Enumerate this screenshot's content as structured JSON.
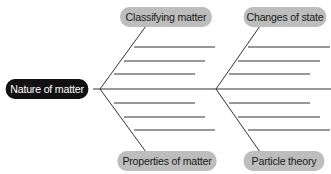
{
  "diagram": {
    "type": "fishbone",
    "head": {
      "label": "Nature of matter",
      "style": "dark"
    },
    "branches": [
      {
        "label": "Classifying matter",
        "position": "top-left",
        "lines": 3
      },
      {
        "label": "Changes of state",
        "position": "top-right",
        "lines": 3
      },
      {
        "label": "Properties of matter",
        "position": "bottom-left",
        "lines": 3
      },
      {
        "label": "Particle theory",
        "position": "bottom-right",
        "lines": 3
      }
    ],
    "colors": {
      "head_bg": "#111111",
      "head_text": "#ffffff",
      "branch_bg": "#bdbdbd",
      "branch_text": "#1a1a1a",
      "line": "#333333"
    }
  }
}
